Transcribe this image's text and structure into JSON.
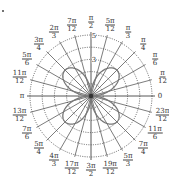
{
  "diagram": {
    "type": "polar-graph",
    "center": [
      91,
      96
    ],
    "unit_px": 12.2,
    "radial_max": 5,
    "radial_circles": [
      1,
      2,
      3,
      4,
      5
    ],
    "radial_labels": [
      {
        "text": "5",
        "r": 5
      },
      {
        "text": "3",
        "r": 3
      }
    ],
    "curve": {
      "description": "four-petal rose",
      "equation": "r = 3|sin 2θ|",
      "amplitude": 3,
      "petals": 4,
      "color": "#777777"
    },
    "spoke_step_deg": 15,
    "angle_labels": [
      {
        "deg": 0,
        "num": "0",
        "den": ""
      },
      {
        "deg": 15,
        "num": "π",
        "den": "12"
      },
      {
        "deg": 30,
        "num": "π",
        "den": "6"
      },
      {
        "deg": 45,
        "num": "π",
        "den": "4"
      },
      {
        "deg": 60,
        "num": "π",
        "den": "3"
      },
      {
        "deg": 75,
        "num": "5π",
        "den": "12"
      },
      {
        "deg": 90,
        "num": "π",
        "den": "2"
      },
      {
        "deg": 105,
        "num": "7π",
        "den": "12"
      },
      {
        "deg": 120,
        "num": "2π",
        "den": "3"
      },
      {
        "deg": 135,
        "num": "3π",
        "den": "4"
      },
      {
        "deg": 150,
        "num": "5π",
        "den": "6"
      },
      {
        "deg": 165,
        "num": "11π",
        "den": "12"
      },
      {
        "deg": 180,
        "num": "π",
        "den": ""
      },
      {
        "deg": 195,
        "num": "13π",
        "den": "12"
      },
      {
        "deg": 210,
        "num": "7π",
        "den": "6"
      },
      {
        "deg": 225,
        "num": "5π",
        "den": "4"
      },
      {
        "deg": 240,
        "num": "4π",
        "den": "3"
      },
      {
        "deg": 255,
        "num": "17π",
        "den": "12"
      },
      {
        "deg": 270,
        "num": "3π",
        "den": "2"
      },
      {
        "deg": 285,
        "num": "19π",
        "den": "12"
      },
      {
        "deg": 300,
        "num": "5π",
        "den": "3"
      },
      {
        "deg": 315,
        "num": "7π",
        "den": "4"
      },
      {
        "deg": 330,
        "num": "11π",
        "den": "6"
      },
      {
        "deg": 345,
        "num": "23π",
        "den": "12"
      }
    ],
    "colors": {
      "grid": "#444444",
      "circle": "#555555",
      "text": "#333333",
      "background": "#ffffff"
    }
  }
}
